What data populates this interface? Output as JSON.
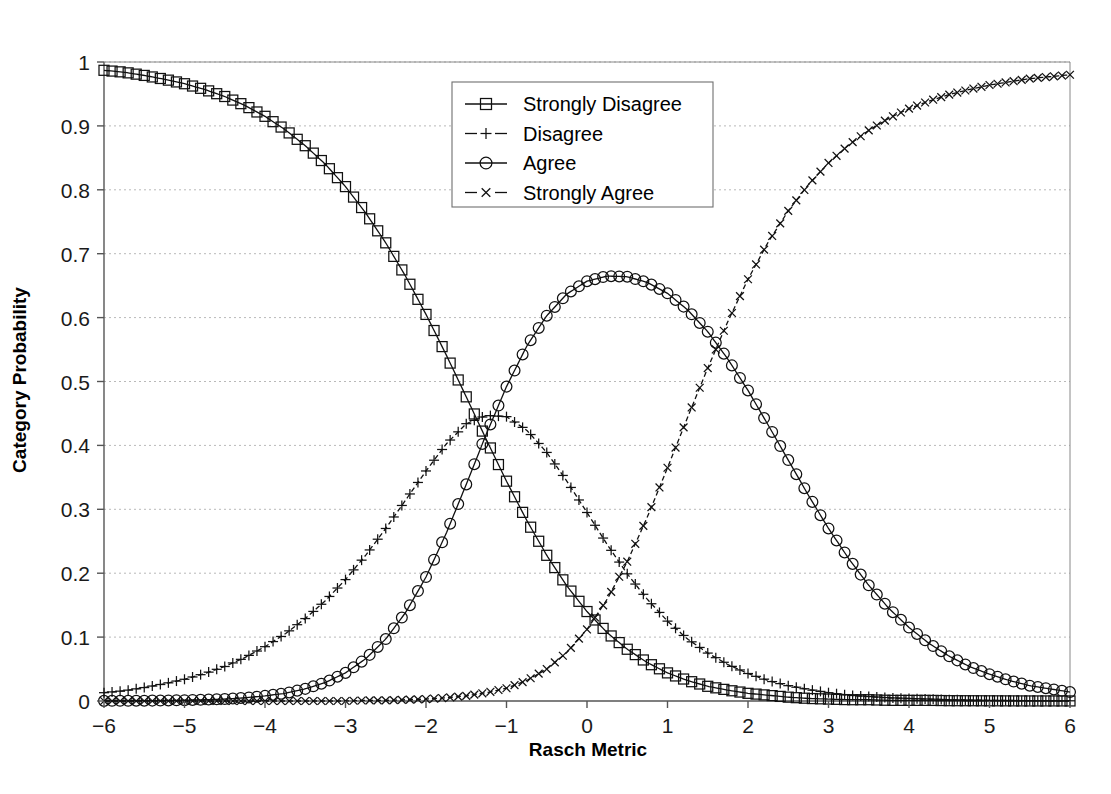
{
  "chart_data": {
    "type": "line",
    "title": "",
    "xlabel": "Rasch Metric",
    "ylabel": "Category Probability",
    "xlim": [
      -6,
      6
    ],
    "ylim": [
      0,
      1
    ],
    "xticks": [
      "-6",
      "-5",
      "-4",
      "-3",
      "-2",
      "-1",
      "0",
      "1",
      "2",
      "3",
      "4",
      "5",
      "6"
    ],
    "yticks": [
      "0",
      "0.1",
      "0.2",
      "0.3",
      "0.4",
      "0.5",
      "0.6",
      "0.7",
      "0.8",
      "0.9",
      "1"
    ],
    "grid": "horizontal-dotted",
    "legend_position": "top-center-right",
    "model": "rasch-rating-scale-category-probability",
    "thresholds": [
      -1.65,
      -0.52,
      2.3
    ],
    "x": [
      -6,
      -5.75,
      -5.5,
      -5.25,
      -5,
      -4.75,
      -4.5,
      -4.25,
      -4,
      -3.75,
      -3.5,
      -3.25,
      -3,
      -2.75,
      -2.5,
      -2.25,
      -2,
      -1.75,
      -1.5,
      -1.25,
      -1,
      -0.75,
      -0.5,
      -0.25,
      0,
      0.25,
      0.5,
      0.75,
      1,
      1.25,
      1.5,
      1.75,
      2,
      2.25,
      2.5,
      2.75,
      3,
      3.25,
      3.5,
      3.75,
      4,
      4.25,
      4.5,
      4.75,
      5,
      5.25,
      5.5,
      5.75,
      6
    ],
    "series": [
      {
        "name": "Strongly Disagree",
        "marker": "square",
        "line_style": "solid",
        "values": [
          0.987,
          0.984,
          0.979,
          0.973,
          0.966,
          0.957,
          0.946,
          0.932,
          0.915,
          0.894,
          0.869,
          0.84,
          0.805,
          0.764,
          0.717,
          0.664,
          0.605,
          0.542,
          0.476,
          0.409,
          0.344,
          0.283,
          0.228,
          0.18,
          0.14,
          0.107,
          0.081,
          0.06,
          0.044,
          0.032,
          0.023,
          0.017,
          0.012,
          0.009,
          0.006,
          0.004,
          0.003,
          0.002,
          0.002,
          0.001,
          0.001,
          0.001,
          0.0005,
          0.0004,
          0.0003,
          0.0002,
          0.0001,
          0.0001,
          0.0001
        ]
      },
      {
        "name": "Disagree",
        "marker": "plus",
        "line_style": "dashed",
        "values": [
          0.013,
          0.016,
          0.021,
          0.027,
          0.034,
          0.043,
          0.054,
          0.068,
          0.085,
          0.105,
          0.129,
          0.157,
          0.19,
          0.228,
          0.27,
          0.315,
          0.36,
          0.402,
          0.434,
          0.447,
          0.445,
          0.424,
          0.389,
          0.344,
          0.295,
          0.245,
          0.199,
          0.159,
          0.125,
          0.097,
          0.075,
          0.057,
          0.043,
          0.032,
          0.024,
          0.018,
          0.013,
          0.009,
          0.007,
          0.005,
          0.004,
          0.003,
          0.002,
          0.0015,
          0.001,
          0.0008,
          0.0006,
          0.0004,
          0.0003
        ]
      },
      {
        "name": "Agree",
        "marker": "circle",
        "line_style": "solid",
        "values": [
          0.0002,
          0.0003,
          0.0005,
          0.0008,
          0.0013,
          0.002,
          0.003,
          0.005,
          0.008,
          0.012,
          0.019,
          0.029,
          0.044,
          0.066,
          0.097,
          0.139,
          0.194,
          0.262,
          0.339,
          0.418,
          0.492,
          0.555,
          0.603,
          0.637,
          0.657,
          0.665,
          0.664,
          0.655,
          0.638,
          0.612,
          0.578,
          0.535,
          0.486,
          0.432,
          0.377,
          0.322,
          0.27,
          0.223,
          0.181,
          0.145,
          0.115,
          0.09,
          0.07,
          0.054,
          0.042,
          0.032,
          0.024,
          0.019,
          0.014
        ]
      },
      {
        "name": "Strongly Agree",
        "marker": "cross",
        "line_style": "dashed",
        "values": [
          0.0,
          0.0,
          0.0,
          0.0,
          0.0,
          0.0,
          0.0,
          0.0,
          0.0,
          0.0,
          0.0,
          0.0,
          0.0,
          0.001,
          0.001,
          0.002,
          0.003,
          0.005,
          0.008,
          0.013,
          0.02,
          0.032,
          0.05,
          0.076,
          0.112,
          0.159,
          0.218,
          0.288,
          0.365,
          0.444,
          0.521,
          0.594,
          0.66,
          0.718,
          0.767,
          0.808,
          0.842,
          0.87,
          0.893,
          0.912,
          0.927,
          0.939,
          0.949,
          0.957,
          0.964,
          0.969,
          0.974,
          0.977,
          0.98
        ]
      }
    ]
  },
  "legend": {
    "entries": [
      {
        "label": "Strongly Disagree"
      },
      {
        "label": "Disagree"
      },
      {
        "label": "Agree"
      },
      {
        "label": "Strongly Agree"
      }
    ]
  },
  "colors": {
    "curve": "#111111",
    "grid": "#b9b9b9",
    "axis": "#555555",
    "background": "#ffffff"
  }
}
